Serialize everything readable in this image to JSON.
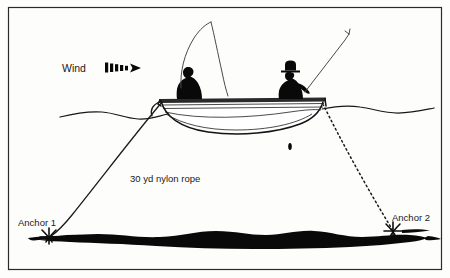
{
  "figure": {
    "background_color": "#fdfdfc",
    "ink_color": "#111111",
    "frame_color": "#2a2a2a"
  },
  "labels": {
    "wind": "Wind",
    "rope": "30 yd nylon rope",
    "anchor_1": "Anchor 1",
    "anchor_2": "Anchor 2"
  },
  "icons": {
    "wind_arrow": "wind-arrow-icon",
    "anchor_1_symbol": "anchor-icon",
    "anchor_2_symbol": "anchor-icon"
  },
  "scene": {
    "boat": "rowboat",
    "anglers": 2,
    "rods": 2,
    "water_surface": "wavy-water-line",
    "lake_bed": "lake-bottom-silhouette",
    "rope_1_style": "solid",
    "rope_2_style": "dashed"
  }
}
